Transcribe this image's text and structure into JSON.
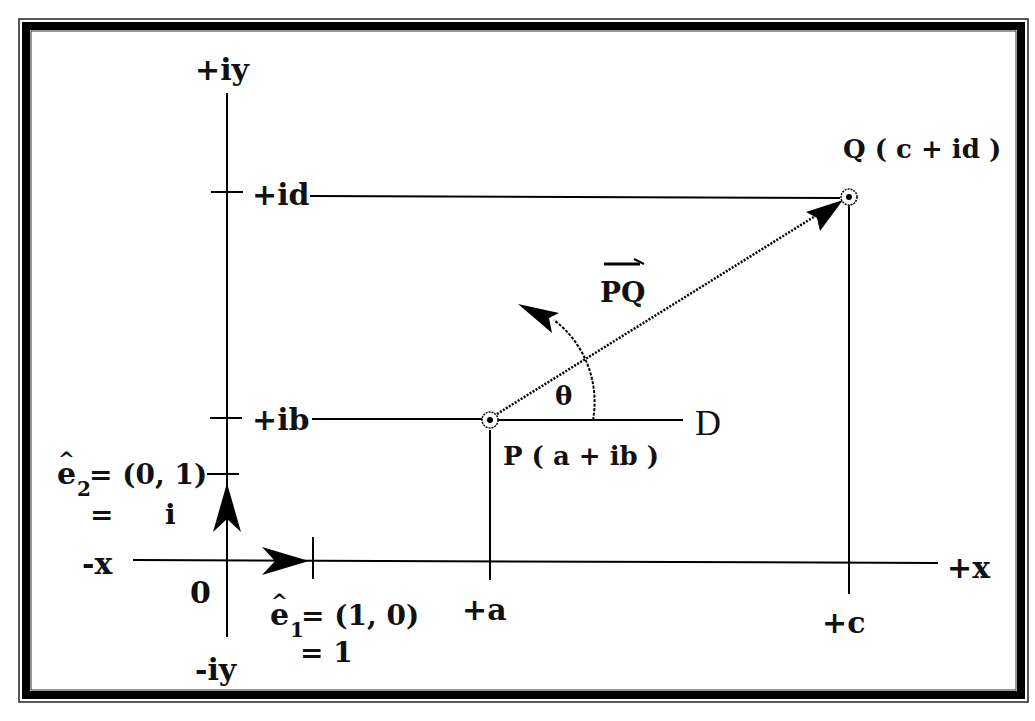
{
  "diagram": {
    "axes": {
      "pos_y": "+iy",
      "neg_y": "-iy",
      "pos_x": "+x",
      "neg_x": "-x",
      "origin": "0"
    },
    "ticks": {
      "id": "+id",
      "ib": "+ib",
      "a": "+a",
      "c": "+c"
    },
    "points": {
      "P": {
        "label": "P ( a + ib )"
      },
      "Q": {
        "label": "Q ( c + id )"
      }
    },
    "vector_label": "PQ",
    "angle_label": "θ",
    "reference_line_label": "D",
    "unit_vectors": {
      "e1": {
        "base": "e",
        "sub": "1",
        "eq": "= (1, 0)",
        "value_line": "=  1"
      },
      "e2": {
        "base": "e",
        "sub": "2",
        "eq": "= (0, 1)",
        "value_eq": "=",
        "value": "i"
      }
    },
    "hat": "^"
  }
}
